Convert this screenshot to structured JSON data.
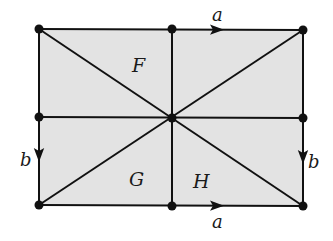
{
  "diagram": {
    "type": "polygon-identification",
    "fill_color": "#e3e3e3",
    "line_color": "#111111",
    "vertices": {
      "tl": [
        39,
        29
      ],
      "tm": [
        172,
        29
      ],
      "tr": [
        303,
        30
      ],
      "ml": [
        39,
        117
      ],
      "c": [
        172,
        118
      ],
      "mr": [
        303,
        118
      ],
      "bl": [
        39,
        205
      ],
      "bm": [
        172,
        206
      ],
      "br": [
        303,
        206
      ]
    },
    "regions": [
      {
        "label": "F",
        "x": 136,
        "y": 68
      },
      {
        "label": "G",
        "x": 139,
        "y": 180
      },
      {
        "label": "H",
        "x": 203,
        "y": 182
      }
    ],
    "edge_labels": [
      {
        "label": "a",
        "x": 218,
        "y": 19,
        "edge": "top"
      },
      {
        "label": "a",
        "x": 218,
        "y": 225,
        "edge": "bottom"
      },
      {
        "label": "b",
        "x": 27,
        "y": 161,
        "edge": "left"
      },
      {
        "label": "b",
        "x": 313,
        "y": 163,
        "edge": "right"
      }
    ]
  }
}
